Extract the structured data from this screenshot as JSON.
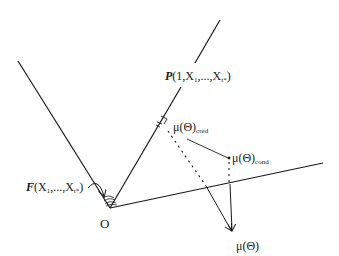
{
  "diagram": {
    "origin_label": "O",
    "p_vector": {
      "prefix": "P",
      "args": "(1,X",
      "sub1": "1",
      "mid": ",...,X",
      "sub2": "t*",
      "suffix": ")"
    },
    "f_angle": {
      "prefix": "F",
      "args": "(X",
      "sub1": "1",
      "mid": ",...,X",
      "sub2": "t*",
      "suffix": ")"
    },
    "mu_cred": {
      "base": "μ(Θ)",
      "sub": "cred"
    },
    "mu_cond": {
      "base": "μ(Θ)",
      "sub": "cond"
    },
    "mu": {
      "base": "μ(Θ)"
    }
  },
  "colors": {
    "line": "#1a1a1a",
    "background": "#ffffff"
  }
}
